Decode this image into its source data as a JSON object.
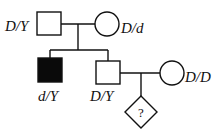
{
  "diagram": {
    "type": "pedigree",
    "colors": {
      "line": "#111111",
      "affected": "#0a0a0a",
      "unaffected": "#ffffff"
    },
    "individuals": [
      {
        "id": "father",
        "sex": "male",
        "affected": false,
        "genotype": "D/Y",
        "generation": 1
      },
      {
        "id": "mother",
        "sex": "female",
        "affected": false,
        "genotype": "D/d",
        "generation": 1
      },
      {
        "id": "son-affected",
        "sex": "male",
        "affected": true,
        "genotype": "d/Y",
        "generation": 2
      },
      {
        "id": "son-unaffected",
        "sex": "male",
        "affected": false,
        "genotype": "D/Y",
        "generation": 2
      },
      {
        "id": "spouse",
        "sex": "female",
        "affected": false,
        "genotype": "D/D",
        "generation": 2
      },
      {
        "id": "child",
        "sex": "unknown",
        "affected": null,
        "genotype": "?",
        "generation": 3
      }
    ],
    "labels": {
      "father": "D/Y",
      "mother": "D/d",
      "son_affected": "d/Y",
      "son_unaffected": "D/Y",
      "spouse": "D/D",
      "child": "?"
    }
  }
}
